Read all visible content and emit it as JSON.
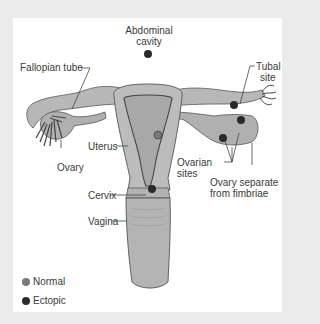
{
  "diagram": {
    "labels": {
      "abdominal_cavity_line1": "Abdominal",
      "abdominal_cavity_line2": "cavity",
      "fallopian_tube": "Fallopian tube",
      "tubal_site_line1": "Tubal",
      "tubal_site_line2": "site",
      "uterus": "Uterus",
      "ovary": "Ovary",
      "ovarian_sites_line1": "Ovarian",
      "ovarian_sites_line2": "sites",
      "ovary_separate_line1": "Ovary separate",
      "ovary_separate_line2": "from fimbriae",
      "cervix": "Cervix",
      "vagina": "Vagina"
    },
    "legend": [
      {
        "label": "Normal",
        "color": "#7a7a7a"
      },
      {
        "label": "Ectopic",
        "color": "#2a2a2a"
      }
    ],
    "colors": {
      "background": "#ebebeb",
      "panel": "#ffffff",
      "tissue": "#b5b5b5",
      "tissue_dark": "#8f8f8f",
      "outline": "#555555",
      "ectopic_dot": "#2a2a2a",
      "normal_dot": "#7a7a7a"
    }
  }
}
